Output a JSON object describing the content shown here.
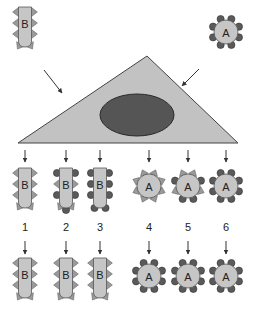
{
  "figure": {
    "colors": {
      "cell_fill": "#c6c6c6",
      "cell_stroke": "#555555",
      "host_fill": "#c2c2c2",
      "host_stroke": "#444444",
      "nucleus_fill": "#555555",
      "nucleus_stroke": "#2a2a2a",
      "spike_fill": "#9a9a9a",
      "ball_fill": "#5a5a5a",
      "arrow": "#333333"
    },
    "source_cells": [
      {
        "id": "B",
        "label": "B",
        "shape": "rod",
        "surface": [
          "spike",
          "spike",
          "spike",
          "spike",
          "spike",
          "spike",
          "spike",
          "spike"
        ]
      },
      {
        "id": "A",
        "label": "A",
        "shape": "sphere",
        "surface": [
          "ball",
          "ball",
          "ball",
          "ball",
          "ball",
          "ball",
          "ball",
          "ball"
        ]
      }
    ],
    "host_cell": {
      "shape": "triangle",
      "has_nucleus": true
    },
    "progeny": [
      {
        "number": "1",
        "label": "B",
        "shape": "rod",
        "top_pattern": "all-spikes",
        "bottom_label": "B",
        "bottom_pattern": "all-spikes"
      },
      {
        "number": "2",
        "label": "B",
        "shape": "rod",
        "top_pattern": "mixed",
        "bottom_label": "B",
        "bottom_pattern": "all-spikes"
      },
      {
        "number": "3",
        "label": "B",
        "shape": "rod",
        "top_pattern": "all-balls",
        "bottom_label": "B",
        "bottom_pattern": "all-spikes"
      },
      {
        "number": "4",
        "label": "A",
        "shape": "sphere",
        "top_pattern": "all-spikes",
        "bottom_label": "A",
        "bottom_pattern": "all-balls"
      },
      {
        "number": "5",
        "label": "A",
        "shape": "sphere",
        "top_pattern": "mixed",
        "bottom_label": "A",
        "bottom_pattern": "all-balls"
      },
      {
        "number": "6",
        "label": "A",
        "shape": "sphere",
        "top_pattern": "all-balls",
        "bottom_label": "A",
        "bottom_pattern": "all-balls"
      }
    ]
  }
}
